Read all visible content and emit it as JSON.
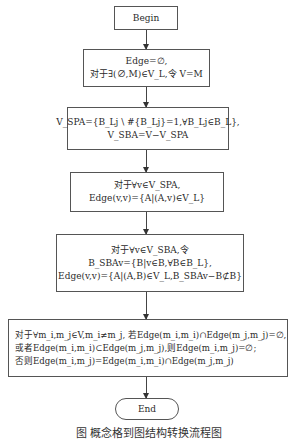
{
  "diagram": {
    "type": "flowchart",
    "nodes": [
      {
        "id": "begin",
        "shape": "rectangle",
        "lines": [
          "Begin"
        ]
      },
      {
        "id": "init",
        "shape": "rectangle",
        "lines": [
          "Edge=∅,",
          "对于∃(∅,M)∈V_L,令 V=M"
        ]
      },
      {
        "id": "spa-sba",
        "shape": "rectangle",
        "lines": [
          "V_SPA={B_Lj \\ #{B_Lj}=1,∀B_Lj∈B_L},",
          "V_SBA=V−V_SPA"
        ]
      },
      {
        "id": "edge-spa",
        "shape": "rectangle",
        "lines": [
          "对于∀v∈V_SPA,",
          "Edge(v,v)={A|(A,v)∈V_L}"
        ]
      },
      {
        "id": "edge-sba",
        "shape": "rectangle",
        "lines": [
          "对于∀v∈V_SBA,令",
          "B_SBAv={B|v∈B,∀B∈B_L},",
          "Edge(v,v)={A|(A,B)∈V_L,B_SBAv−B⊄B}"
        ]
      },
      {
        "id": "edge-pairs",
        "shape": "rectangle",
        "lines": [
          "对于∀m_i,m_j∈V,m_i≠m_j, 若Edge(m_i,m_i)∩Edge(m_j,m_j)=∅,",
          "或者Edge(m_i,m_i)⊂Edge(m_j,m_j),则Edge(m_i,m_j)=∅;",
          "否则Edge(m_i,m_j)=Edge(m_i,m_i)∩Edge(m_j,m_j)"
        ]
      },
      {
        "id": "end",
        "shape": "terminal",
        "lines": [
          "End"
        ]
      }
    ],
    "edges": [
      {
        "from": "begin",
        "to": "init"
      },
      {
        "from": "init",
        "to": "spa-sba"
      },
      {
        "from": "spa-sba",
        "to": "edge-spa"
      },
      {
        "from": "edge-spa",
        "to": "edge-sba"
      },
      {
        "from": "edge-sba",
        "to": "edge-pairs"
      },
      {
        "from": "edge-pairs",
        "to": "end"
      }
    ],
    "caption": "图   概念格到图结构转换流程图"
  }
}
